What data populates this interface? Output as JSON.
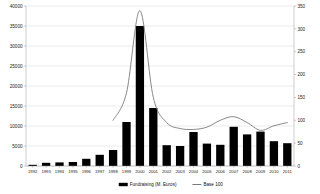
{
  "chart_data": {
    "type": "bar",
    "title": "",
    "subtitle": "",
    "xlabel": "",
    "ylabel": "",
    "y2label": "",
    "grid": true,
    "legend_position": "bottom",
    "categories": [
      "1992",
      "1993",
      "1994",
      "1995",
      "1996",
      "1997",
      "1998",
      "1999",
      "2000",
      "2001",
      "2002",
      "2003",
      "2004",
      "2005",
      "2006",
      "2007",
      "2008",
      "2009",
      "2010",
      "2011"
    ],
    "ylim": [
      0,
      40000
    ],
    "yticks": [
      "0",
      "5000",
      "10000",
      "15000",
      "20000",
      "25000",
      "30000",
      "35000",
      "40000"
    ],
    "ytick_values": [
      0,
      5000,
      10000,
      15000,
      20000,
      25000,
      30000,
      35000,
      40000
    ],
    "y2lim": [
      0,
      350
    ],
    "y2ticks": [
      "0",
      "50",
      "100",
      "150",
      "200",
      "250",
      "300",
      "350"
    ],
    "y2tick_values": [
      0,
      50,
      100,
      150,
      200,
      250,
      300,
      350
    ],
    "series": [
      {
        "name": "Fundraising (M. Euros)",
        "type": "bar",
        "axis": "left",
        "color": "#000000",
        "values": [
          300,
          800,
          900,
          1000,
          1800,
          2800,
          4000,
          11000,
          35000,
          14500,
          5200,
          5000,
          8500,
          5600,
          5300,
          9800,
          7900,
          8600,
          6200,
          5700
        ]
      },
      {
        "name": "Base 100",
        "type": "line",
        "axis": "right",
        "color": "#7a7a7a",
        "values": [
          null,
          null,
          null,
          null,
          null,
          null,
          100,
          160,
          340,
          150,
          95,
          82,
          80,
          85,
          100,
          108,
          95,
          78,
          88,
          95
        ]
      }
    ],
    "legend": [
      {
        "label": "Fundraising (M. Euros)",
        "marker": "bar-swatch",
        "color": "#000000"
      },
      {
        "label": "Base 100",
        "marker": "line-swatch",
        "color": "#7a7a7a"
      }
    ]
  }
}
